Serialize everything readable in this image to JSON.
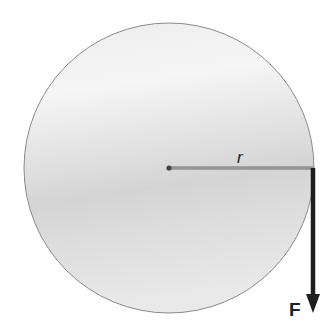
{
  "diagram": {
    "title": "",
    "labels": {
      "radius": "r",
      "force": "F"
    },
    "colors": {
      "disk_fill_light": "#f1f1f1",
      "disk_fill_dark": "#cdcdcd",
      "disk_outline": "#8a8a8a",
      "radius_line": "#777777",
      "force_arrow": "#1e1e1e"
    },
    "geometry": {
      "disk_center": [
        169,
        168
      ],
      "disk_radius": 145,
      "radius_line_end": [
        314,
        168
      ],
      "force_arrow_end": [
        313,
        312
      ]
    }
  }
}
